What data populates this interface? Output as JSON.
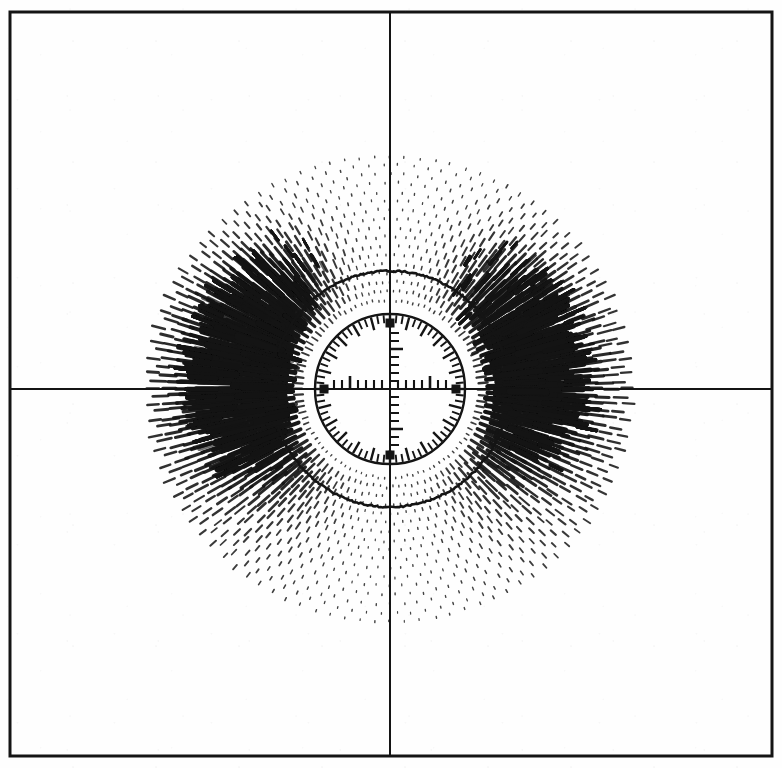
{
  "figure": {
    "kind": "scanned-scientific-figure",
    "title": "",
    "caption": "",
    "background_color": "#fefefe",
    "ink_color": "#141414",
    "frame": {
      "name": "plot-border",
      "left": 10,
      "top": 12,
      "right": 772,
      "bottom": 756,
      "line_width": 3.0
    },
    "axes": {
      "origin_x": 390,
      "origin_y": 389,
      "line_width": 2.0,
      "horizontal_label": "",
      "vertical_label": ""
    },
    "reticle": {
      "name": "center-dial",
      "center_x": 390,
      "center_y": 389,
      "radius": 75,
      "rim_line_width": 2.4,
      "rim_tick_count": 72,
      "rim_tick_long": 13,
      "rim_tick_short": 8,
      "rim_major_every": 3,
      "cardinal_marker_size": 9,
      "cardinal_marker_radius": 66,
      "ruler_tick_spacing": 8,
      "ruler_tick_count": 7,
      "ruler_tick_height": 9,
      "ruler_tick_height_major": 13,
      "axis_stub_line_width": 2.0
    }
  },
  "chart_data": {
    "type": "scatter",
    "title": "",
    "subtitle": "",
    "xlabel": "",
    "ylabel": "",
    "plot_style": "polar quiver / dash field",
    "grid": false,
    "legend": "none",
    "coordinate_system": "polar",
    "xlim": [
      -390,
      392
    ],
    "ylim": [
      -379,
      367
    ],
    "radial_rings": {
      "count": 17,
      "r_min": 88,
      "r_max": 232,
      "r_step": 9.0,
      "samples_per_ring": 96
    },
    "magnitude_model": {
      "angular_form": "|cos(theta)| lobes with asymmetric left/right weighting",
      "left_lobe_gain": 1.16,
      "right_lobe_gain": 1.0,
      "angular_exponent": 2.6,
      "radial_decay": "exp(-(r - r0)/90) with inner boost near r0",
      "max_dash_length_px": 30,
      "min_dash_length_px": 1.6,
      "max_dash_width_px": 4.6,
      "min_dash_width_px": 1.3
    },
    "features": [
      {
        "name": "left-lobe",
        "angle_deg": 180,
        "peak_radius_px": 130,
        "relative_intensity": 1.0,
        "note": "dominant dark jet along negative x-axis"
      },
      {
        "name": "right-lobe",
        "angle_deg": 0,
        "peak_radius_px": 125,
        "relative_intensity": 0.92,
        "note": "dense convergent bundle along positive x-axis"
      },
      {
        "name": "upper-left-knot",
        "angle_deg": 143,
        "peak_radius_px": 142,
        "relative_intensity": 0.88,
        "note": "dark blob above left lobe"
      },
      {
        "name": "upper-right-knot",
        "angle_deg": 34,
        "peak_radius_px": 138,
        "relative_intensity": 0.82,
        "note": "dark blob above right lobe"
      },
      {
        "name": "top-minimum",
        "angle_deg": 90,
        "peak_radius_px": 0,
        "relative_intensity": 0.08,
        "note": "dots only — near-zero magnitude"
      },
      {
        "name": "bottom-minimum",
        "angle_deg": 270,
        "peak_radius_px": 0,
        "relative_intensity": 0.08,
        "note": "dots only — near-zero magnitude"
      }
    ],
    "arc_overlays": [
      {
        "name": "upper-arc-stroke",
        "r": 118,
        "a0_deg": 18,
        "a1_deg": 162
      },
      {
        "name": "lower-arc-stroke",
        "r": 118,
        "a0_deg": 198,
        "a1_deg": 342
      }
    ]
  }
}
